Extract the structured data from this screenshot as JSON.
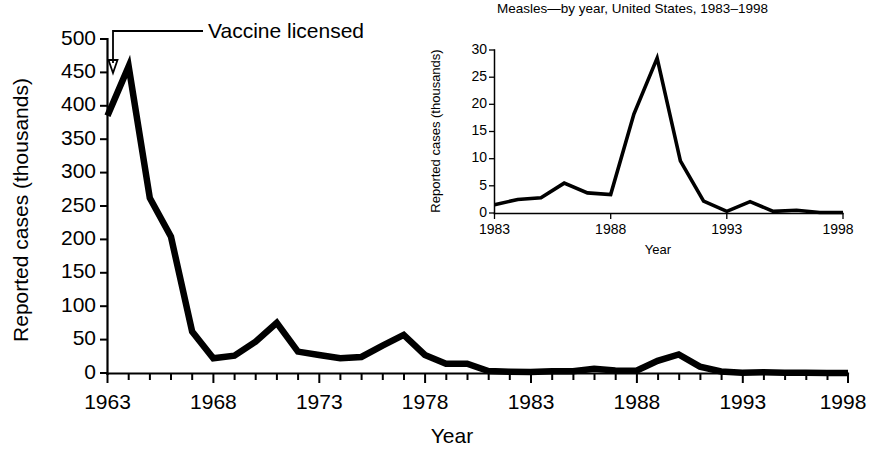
{
  "chart_data": [
    {
      "id": "main",
      "type": "line",
      "title": "",
      "xlabel": "Year",
      "ylabel": "Reported cases (thousands)",
      "xlim": [
        1963,
        1998
      ],
      "ylim": [
        0,
        500
      ],
      "grid": false,
      "legend": "none",
      "ytick_labels": [
        "0",
        "50",
        "100",
        "150",
        "200",
        "250",
        "300",
        "350",
        "400",
        "450",
        "500"
      ],
      "ytick_values": [
        0,
        50,
        100,
        150,
        200,
        250,
        300,
        350,
        400,
        450,
        500
      ],
      "xtick_labels": [
        "1963",
        "1968",
        "1973",
        "1978",
        "1983",
        "1988",
        "1993",
        "1998"
      ],
      "xtick_values": [
        1963,
        1968,
        1973,
        1978,
        1983,
        1988,
        1993,
        1998
      ],
      "x": [
        1963,
        1964,
        1965,
        1966,
        1967,
        1968,
        1969,
        1970,
        1971,
        1972,
        1973,
        1974,
        1975,
        1976,
        1977,
        1978,
        1979,
        1980,
        1981,
        1982,
        1983,
        1984,
        1985,
        1986,
        1987,
        1988,
        1989,
        1990,
        1991,
        1992,
        1993,
        1994,
        1995,
        1996,
        1997,
        1998
      ],
      "values": [
        385,
        459,
        262,
        204,
        62,
        22,
        26,
        47,
        75,
        32,
        27,
        22,
        24,
        41,
        57,
        27,
        14,
        14,
        3,
        2,
        1.5,
        2.5,
        2.8,
        6.3,
        3.7,
        3.4,
        18.2,
        27.8,
        9.6,
        2.2,
        0.3,
        1,
        0.3,
        0.5,
        0.1,
        0.1
      ],
      "annotations": [
        {
          "text": "Vaccine licensed",
          "points_to_year": 1963,
          "points_to_value": 450
        }
      ]
    },
    {
      "id": "inset",
      "type": "line",
      "title": "Measles—by year, United States, 1983–1998",
      "xlabel": "Year",
      "ylabel": "Reported cases (thousands)",
      "xlim": [
        1983,
        1998
      ],
      "ylim": [
        0,
        30
      ],
      "grid": false,
      "legend": "none",
      "ytick_labels": [
        "0",
        "5",
        "10",
        "15",
        "20",
        "25",
        "30"
      ],
      "ytick_values": [
        0,
        5,
        10,
        15,
        20,
        25,
        30
      ],
      "xtick_labels": [
        "1983",
        "1988",
        "1993",
        "1998"
      ],
      "xtick_values": [
        1983,
        1988,
        1993,
        1998
      ],
      "x": [
        1983,
        1984,
        1985,
        1986,
        1987,
        1988,
        1989,
        1990,
        1991,
        1992,
        1993,
        1994,
        1995,
        1996,
        1997,
        1998
      ],
      "values": [
        1.5,
        2.5,
        2.8,
        5.5,
        3.7,
        3.4,
        18.2,
        28.5,
        9.6,
        2.2,
        0.3,
        2.1,
        0.3,
        0.5,
        0.1,
        0.1
      ]
    }
  ]
}
